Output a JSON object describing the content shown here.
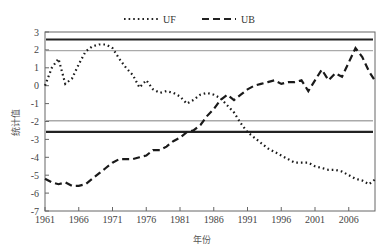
{
  "chart_data": {
    "type": "line",
    "title": "",
    "xlabel": "年份",
    "ylabel": "统计值",
    "xlim": [
      1961,
      2010
    ],
    "ylim": [
      -7,
      3
    ],
    "x_ticks": [
      1961,
      1966,
      1971,
      1976,
      1981,
      1986,
      1991,
      1996,
      2001,
      2006
    ],
    "y_ticks": [
      3,
      2,
      1,
      0,
      -1,
      -2,
      -3,
      -4,
      -5,
      -6,
      -7
    ],
    "grid": false,
    "legend_position": "top",
    "legend": [
      {
        "name": "UF",
        "style": "dotted"
      },
      {
        "name": "UB",
        "style": "dashed"
      }
    ],
    "reference_lines": [
      {
        "value": 2.58,
        "color": "#222222",
        "style": "solid-thick"
      },
      {
        "value": -2.58,
        "color": "#222222",
        "style": "solid-thick"
      },
      {
        "value": 1.96,
        "color": "#aaaaaa",
        "style": "solid"
      },
      {
        "value": -1.96,
        "color": "#aaaaaa",
        "style": "solid"
      }
    ],
    "x": [
      1961,
      1962,
      1963,
      1964,
      1965,
      1966,
      1967,
      1968,
      1969,
      1970,
      1971,
      1972,
      1973,
      1974,
      1975,
      1976,
      1977,
      1978,
      1979,
      1980,
      1981,
      1982,
      1983,
      1984,
      1985,
      1986,
      1987,
      1988,
      1989,
      1990,
      1991,
      1992,
      1993,
      1994,
      1995,
      1996,
      1997,
      1998,
      1999,
      2000,
      2001,
      2002,
      2003,
      2004,
      2005,
      2006,
      2007,
      2008,
      2009,
      2010
    ],
    "series": [
      {
        "name": "UF",
        "values": [
          0,
          1.0,
          1.5,
          0.1,
          0.4,
          1.2,
          1.9,
          2.2,
          2.3,
          2.3,
          2.1,
          1.5,
          1.0,
          0.6,
          -0.1,
          0.3,
          -0.2,
          -0.4,
          -0.3,
          -0.4,
          -0.6,
          -1.0,
          -0.8,
          -0.5,
          -0.4,
          -0.5,
          -0.7,
          -1.1,
          -1.5,
          -2.1,
          -2.6,
          -2.9,
          -3.2,
          -3.5,
          -3.7,
          -3.9,
          -4.1,
          -4.3,
          -4.3,
          -4.3,
          -4.5,
          -4.6,
          -4.7,
          -4.7,
          -4.8,
          -5.0,
          -5.2,
          -5.3,
          -5.5,
          -5.2
        ]
      },
      {
        "name": "UB",
        "values": [
          -5.2,
          -5.4,
          -5.5,
          -5.4,
          -5.6,
          -5.6,
          -5.5,
          -5.2,
          -4.9,
          -4.6,
          -4.3,
          -4.1,
          -4.1,
          -4.1,
          -4.0,
          -3.9,
          -3.6,
          -3.6,
          -3.4,
          -3.1,
          -2.9,
          -2.6,
          -2.5,
          -2.2,
          -1.7,
          -1.3,
          -0.8,
          -0.5,
          -0.8,
          -0.5,
          -0.2,
          0.0,
          0.1,
          0.2,
          0.3,
          0.1,
          0.2,
          0.2,
          0.3,
          -0.3,
          0.3,
          0.9,
          0.3,
          0.7,
          0.5,
          1.3,
          2.1,
          1.6,
          0.8,
          0.2
        ]
      }
    ]
  },
  "labels": {
    "legend_uf": "UF",
    "legend_ub": "UB",
    "xlabel": "年份",
    "ylabel": "统计值"
  }
}
